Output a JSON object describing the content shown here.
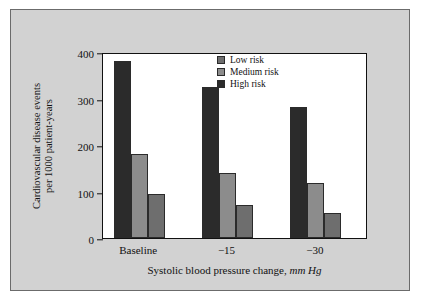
{
  "chart_data": {
    "type": "bar",
    "title": "",
    "xlabel": "Systolic blood pressure change, mm Hg",
    "xlabel_plain": "Systolic blood pressure change,",
    "xlabel_italic": "mm Hg",
    "ylabel_line1": "Cardiovascular disease events",
    "ylabel_line2": "per 1000 patient-years",
    "ylabel": "Cardiovascular disease events per 1000 patient-years",
    "categories": [
      "Baseline",
      "−15",
      "−30"
    ],
    "ylim": [
      0,
      400
    ],
    "yticks": [
      0,
      100,
      200,
      300,
      400
    ],
    "ytick_labels": [
      "0",
      "100",
      "200",
      "300",
      "400"
    ],
    "grid": false,
    "legend_position": "top-right",
    "series": [
      {
        "name": "Low risk",
        "color": "#6e6e6e",
        "values": [
          95,
          70,
          53
        ]
      },
      {
        "name": "Medium risk",
        "color": "#8c8c8c",
        "values": [
          180,
          140,
          118
        ]
      },
      {
        "name": "High risk",
        "color": "#2b2b2b",
        "values": [
          380,
          325,
          281
        ]
      }
    ],
    "bar_order_in_group": [
      "High risk",
      "Medium risk",
      "Low risk"
    ]
  },
  "figure": {
    "panel_color": "#d2d2d2",
    "plot_background": "#ffffff",
    "axis_color": "#111111"
  },
  "legend": {
    "items": [
      {
        "label": "Low risk",
        "color": "#6e6e6e"
      },
      {
        "label": "Medium risk",
        "color": "#8c8c8c"
      },
      {
        "label": "High risk",
        "color": "#2b2b2b"
      }
    ]
  }
}
